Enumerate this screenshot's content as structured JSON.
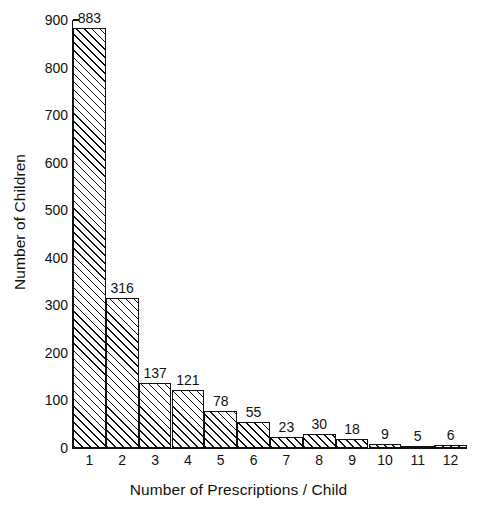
{
  "chart_data": {
    "type": "bar",
    "title": "",
    "xlabel": "Number of Prescriptions / Child",
    "ylabel": "Number of Children",
    "categories": [
      "1",
      "2",
      "3",
      "4",
      "5",
      "6",
      "7",
      "8",
      "9",
      "10",
      "11",
      "12"
    ],
    "values": [
      883,
      316,
      137,
      121,
      78,
      55,
      23,
      30,
      18,
      9,
      5,
      6
    ],
    "value_labels": [
      "883",
      "316",
      "137",
      "121",
      "78",
      "55",
      "23",
      "30",
      "18",
      "9",
      "5",
      "6"
    ],
    "ylim": [
      0,
      900
    ],
    "yticks": [
      0,
      100,
      200,
      300,
      400,
      500,
      600,
      700,
      800,
      900
    ],
    "ytick_labels": [
      "0",
      "100",
      "200",
      "300",
      "400",
      "500",
      "600",
      "700",
      "800",
      "900"
    ],
    "xlim": [
      0.5,
      12.5
    ],
    "grid": false,
    "legend": null,
    "bar_style": {
      "fill": "#ffffff",
      "hatch": "diagonal-forward-slash",
      "edge_color": "#111111"
    }
  },
  "colors": {
    "background": "#ffffff",
    "foreground": "#111111"
  }
}
